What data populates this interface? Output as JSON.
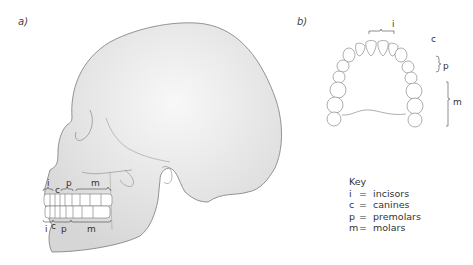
{
  "panels": {
    "a": {
      "label": "a)",
      "view": "lateral skull",
      "upper_labels": [
        "i",
        "c",
        "p",
        "m"
      ],
      "lower_labels": [
        "i",
        "c",
        "p",
        "m"
      ]
    },
    "b": {
      "label": "b)",
      "view": "upper dental arch (occlusal)",
      "labels": [
        "i",
        "c",
        "p",
        "m"
      ]
    }
  },
  "key": {
    "title": "Key",
    "items": [
      {
        "symbol": "i",
        "eq": "=",
        "meaning": "incisors"
      },
      {
        "symbol": "c",
        "eq": "=",
        "meaning": "canines"
      },
      {
        "symbol": "p",
        "eq": "=",
        "meaning": "premolars"
      },
      {
        "symbol": "m",
        "eq": "=",
        "meaning": "molars"
      }
    ]
  },
  "colors": {
    "skull_edge": "#d9d9d9",
    "skull_center": "#f7f7f7",
    "outline": "#7a7a7a",
    "tooth": "#ffffff"
  }
}
